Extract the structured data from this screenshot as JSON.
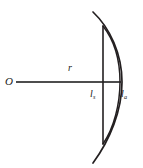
{
  "figure": {
    "background_color": "#ffffff",
    "stroke_color": "#231f20",
    "axis_color": "#4d4d4d",
    "width": 143,
    "height": 168
  },
  "labels": {
    "center_point": "O",
    "radius": "r",
    "chord_symbol": "l",
    "chord_subscript": "s",
    "arc_symbol": "l",
    "arc_subscript": "a"
  },
  "geometry": {
    "center": {
      "x": 16,
      "y": 82
    },
    "radius_line": {
      "x1": 16,
      "y1": 82,
      "x2": 121,
      "y2": 82
    },
    "chord_line": {
      "x": 103,
      "y_top": 26,
      "y_bottom": 144
    },
    "arc": {
      "start": {
        "x": 93,
        "y": 12
      },
      "end": {
        "x": 93,
        "y": 163
      },
      "apex": {
        "x": 121,
        "y": 82
      }
    },
    "inner_arc": {
      "start": {
        "x": 103,
        "y": 26
      },
      "end": {
        "x": 103,
        "y": 144
      },
      "apex": {
        "x": 120,
        "y": 82
      }
    }
  },
  "elements": [
    {
      "name": "center-point-label",
      "text": "O"
    },
    {
      "name": "radius-label",
      "text": "r"
    },
    {
      "name": "chord-length-label",
      "text": "ls"
    },
    {
      "name": "arc-length-label",
      "text": "la"
    }
  ]
}
